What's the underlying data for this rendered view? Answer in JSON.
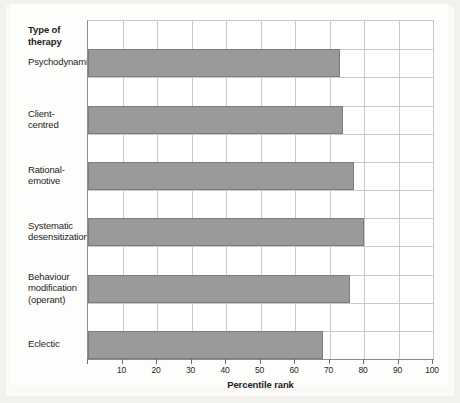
{
  "figure": {
    "category_header": "Type of\ntherapy",
    "axis_title": "Percentile rank",
    "background_color": "#f3f1ed",
    "bar_fill_color": "#9a9a9a",
    "bar_stroke_color": "#7c7c7c",
    "grid_color": "#c9c9c9"
  },
  "chart_data": {
    "type": "bar",
    "orientation": "horizontal",
    "title": "",
    "subtitle": "",
    "xlabel": "Percentile rank",
    "ylabel": "Type of therapy",
    "xlim": [
      0,
      100
    ],
    "xticks": [
      0,
      10,
      20,
      30,
      40,
      50,
      60,
      70,
      80,
      90,
      100
    ],
    "xtick_labels": [
      "",
      "10",
      "20",
      "30",
      "40",
      "50",
      "60",
      "70",
      "80",
      "90",
      "100"
    ],
    "grid": true,
    "legend": false,
    "categories": [
      "Psychodynamic",
      "Client-centred",
      "Rational-emotive",
      "Systematic desensitization",
      "Behaviour modification (operant)",
      "Eclectic"
    ],
    "category_lines": [
      [
        "Psychodynamic"
      ],
      [
        "Client-",
        "centred"
      ],
      [
        "Rational-",
        "emotive"
      ],
      [
        "Systematic",
        "desensitization"
      ],
      [
        "Behaviour",
        "modification",
        "(operant)"
      ],
      [
        "Eclectic"
      ]
    ],
    "values": [
      73,
      74,
      77,
      80,
      76,
      68
    ]
  }
}
